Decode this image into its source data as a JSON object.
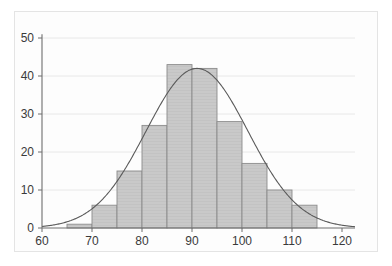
{
  "chart_data": {
    "type": "bar",
    "title": "",
    "subtitle": "",
    "xlabel": "",
    "ylabel": "",
    "xlim": [
      60,
      122.5
    ],
    "ylim": [
      0,
      51
    ],
    "grid": true,
    "grid_axis": "y",
    "legend": null,
    "bin_width": 5,
    "bin_edges": [
      65,
      70,
      75,
      80,
      85,
      90,
      95,
      100,
      105,
      110,
      115
    ],
    "categories": [
      "65-70",
      "70-75",
      "75-80",
      "80-85",
      "85-90",
      "90-95",
      "95-100",
      "100-105",
      "105-110",
      "110-115"
    ],
    "values": [
      1,
      6,
      15,
      27,
      43,
      42,
      28,
      17,
      10,
      6
    ],
    "xticks": [
      60,
      70,
      80,
      90,
      100,
      110,
      120
    ],
    "xtick_labels": [
      "60",
      "70",
      "80",
      "90",
      "100",
      "110",
      "120"
    ],
    "yticks": [
      0,
      10,
      20,
      30,
      40,
      50
    ],
    "ytick_labels": [
      "0",
      "10",
      "20",
      "30",
      "40",
      "50"
    ],
    "overlay": {
      "type": "line",
      "name": "normal-density-curve",
      "mean": 91,
      "stddev": 10.2,
      "peak_value": 42,
      "color": "#5a5a5a"
    },
    "colors": {
      "bar_fill": "#c9c9c9",
      "bar_edge": "#8c8c8c",
      "curve": "#5a5a5a",
      "axis": "#6e6e6e",
      "grid": "#e8e8e8",
      "tick_text": "#3a3a3a",
      "background": "#fdfdfd",
      "frame": "#e4e4e4"
    }
  }
}
